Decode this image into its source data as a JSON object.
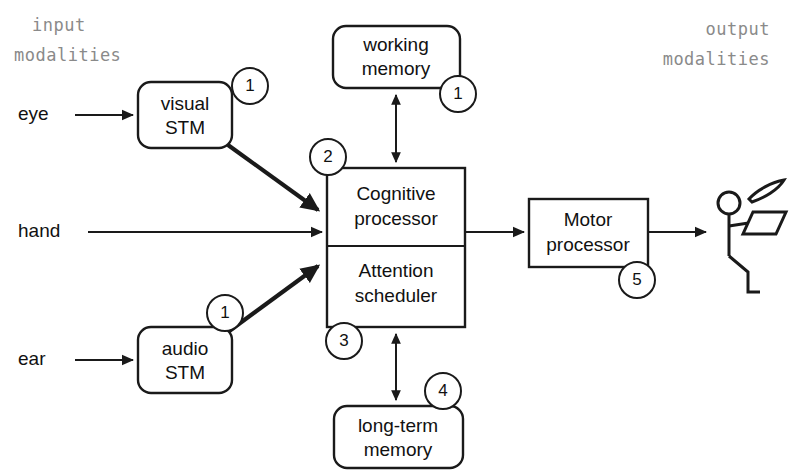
{
  "diagram": {
    "headers": {
      "input": "input\nmodalities",
      "input_line1": "input",
      "input_line2": "modalities",
      "output_line1": "output",
      "output_line2": "modalities"
    },
    "input_labels": [
      {
        "id": "eye",
        "text": "eye"
      },
      {
        "id": "hand",
        "text": "hand"
      },
      {
        "id": "ear",
        "text": "ear"
      }
    ],
    "boxes": [
      {
        "id": "visual-stm",
        "line1": "visual",
        "line2": "STM",
        "shape": "rounded"
      },
      {
        "id": "audio-stm",
        "line1": "audio",
        "line2": "STM",
        "shape": "rounded"
      },
      {
        "id": "working-memory",
        "line1": "working",
        "line2": "memory",
        "shape": "rounded"
      },
      {
        "id": "longterm-memory",
        "line1": "long-term",
        "line2": "memory",
        "shape": "rounded"
      },
      {
        "id": "cognitive-processor",
        "line1": "Cognitive",
        "line2": "processor",
        "shape": "rect"
      },
      {
        "id": "attention-scheduler",
        "line1": "Attention",
        "line2": "scheduler",
        "shape": "rect"
      },
      {
        "id": "motor-processor",
        "line1": "Motor",
        "line2": "processor",
        "shape": "rect"
      }
    ],
    "badges": [
      {
        "id": "badge-visual-stm",
        "number": "1"
      },
      {
        "id": "badge-working-memory",
        "number": "1"
      },
      {
        "id": "badge-audio-stm",
        "number": "1"
      },
      {
        "id": "badge-cognitive",
        "number": "2"
      },
      {
        "id": "badge-attention",
        "number": "3"
      },
      {
        "id": "badge-longterm",
        "number": "4"
      },
      {
        "id": "badge-motor",
        "number": "5"
      }
    ],
    "colors": {
      "stroke": "#1a1a1a",
      "background": "#ffffff",
      "header_text": "#8a8a8a",
      "label_text": "#111111"
    }
  }
}
